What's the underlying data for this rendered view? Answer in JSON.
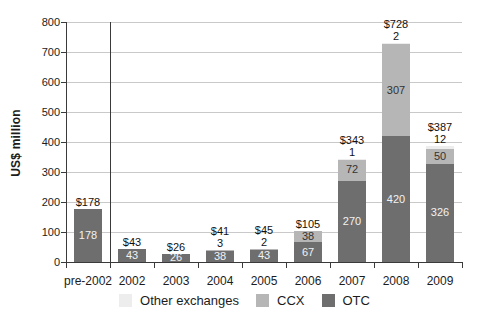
{
  "chart_data": {
    "type": "bar",
    "stacked": true,
    "title": "",
    "ylabel": "US$ million",
    "xlabel": "",
    "ylim": [
      0,
      800
    ],
    "ytick_interval": 100,
    "grid": true,
    "legend_position": "bottom",
    "categories": [
      "pre-2002",
      "2002",
      "2003",
      "2004",
      "2005",
      "2006",
      "2007",
      "2008",
      "2009"
    ],
    "series": [
      {
        "name": "OTC",
        "color": "#6e6e6e",
        "inside_label_color": "#f2f2f2",
        "values": [
          178,
          43,
          26,
          38,
          43,
          67,
          270,
          420,
          326
        ]
      },
      {
        "name": "CCX",
        "color": "#b6b6b6",
        "inside_label_color": "#333333",
        "values": [
          0,
          0,
          0,
          3,
          2,
          38,
          72,
          307,
          50
        ]
      },
      {
        "name": "Other exchanges",
        "color": "#ededed",
        "inside_label_color": "#333333",
        "values": [
          0,
          0,
          0,
          0,
          0,
          0,
          1,
          2,
          12
        ]
      }
    ],
    "total_labels": [
      "$178",
      "$43",
      "$26",
      "$41",
      "$45",
      "$105",
      "$343",
      "$728",
      "$387"
    ],
    "legend_order": [
      "Other exchanges",
      "CCX",
      "OTC"
    ],
    "separator_after_category_index": 0,
    "colors": {
      "axis": "#3a3a3a",
      "grid": "#c9c9c9",
      "text": "#1c1c1c",
      "background": "#ffffff"
    }
  }
}
